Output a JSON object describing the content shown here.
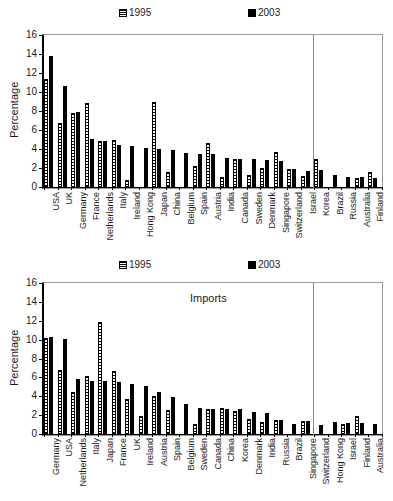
{
  "figure": {
    "width": 393,
    "height": 501,
    "background": "#ffffff",
    "ink_color": "#000000"
  },
  "legend": {
    "entries": [
      {
        "label": "1995",
        "pattern": "horizontal-hatch",
        "color": "#ffffff"
      },
      {
        "label": "2003",
        "pattern": "solid",
        "color": "#000000"
      }
    ]
  },
  "chart_data": [
    {
      "type": "bar",
      "title": "Exports",
      "xlabel": "",
      "ylabel": "Percentage",
      "ylim": [
        0,
        16
      ],
      "yticks": [
        0,
        2,
        4,
        6,
        8,
        10,
        12,
        14,
        16
      ],
      "grid": false,
      "legend_position": "top",
      "divider_after_category": "Israel",
      "categories": [
        "USA",
        "UK",
        "Germany",
        "France",
        "Netherlands",
        "Italy",
        "Ireland",
        "Hong Kong",
        "Japan",
        "China",
        "Belgium",
        "Spain",
        "Austria",
        "India",
        "Canada",
        "Sweden",
        "Denmark",
        "Singapore",
        "Switzerland",
        "Israel",
        "Korea",
        "Brazil",
        "Russia",
        "Australia",
        "Finland"
      ],
      "series": [
        {
          "name": "1995",
          "values": [
            11.4,
            6.7,
            7.8,
            8.8,
            4.8,
            4.9,
            0.7,
            0.0,
            9.0,
            1.6,
            0.0,
            2.2,
            4.6,
            1.1,
            2.9,
            1.3,
            2.0,
            3.7,
            1.9,
            1.2,
            2.9,
            0.0,
            0.0,
            0.9,
            1.6
          ]
        },
        {
          "name": "2003",
          "values": [
            13.8,
            10.6,
            7.9,
            5.1,
            4.8,
            4.4,
            4.3,
            4.1,
            4.0,
            3.9,
            3.6,
            3.5,
            3.5,
            3.1,
            3.0,
            3.0,
            2.8,
            2.7,
            1.9,
            1.7,
            1.8,
            1.3,
            1.1,
            1.1,
            1.0
          ]
        }
      ]
    },
    {
      "type": "bar",
      "title": "Imports",
      "xlabel": "",
      "ylabel": "Percentage",
      "ylim": [
        0,
        16
      ],
      "yticks": [
        0,
        2,
        4,
        6,
        8,
        10,
        12,
        14,
        16
      ],
      "grid": false,
      "legend_position": "top",
      "divider_after_category": "Singapore",
      "categories": [
        "Germany",
        "USA",
        "Netherlands",
        "Italy",
        "Japan",
        "France",
        "UK",
        "Ireland",
        "Austria",
        "Spain",
        "Belgium",
        "Sweden",
        "Canada",
        "China",
        "Korea",
        "Denmark",
        "India",
        "Russia",
        "Brazil",
        "Singapore",
        "Switzerland",
        "Hong Kong",
        "Israel",
        "Finland",
        "Australia"
      ],
      "series": [
        {
          "name": "1995",
          "values": [
            10.2,
            6.8,
            4.5,
            6.2,
            11.9,
            6.7,
            3.7,
            1.9,
            4.0,
            2.5,
            0.0,
            1.1,
            2.6,
            2.8,
            2.4,
            1.6,
            1.3,
            1.5,
            0.0,
            1.4,
            0.0,
            0.0,
            1.1,
            1.9,
            0.0
          ]
        },
        {
          "name": "2003",
          "values": [
            10.3,
            10.1,
            5.8,
            5.6,
            5.6,
            5.5,
            5.3,
            5.1,
            4.5,
            3.9,
            3.2,
            2.8,
            2.7,
            2.7,
            2.7,
            2.3,
            2.2,
            1.5,
            1.1,
            1.4,
            1.0,
            1.3,
            1.2,
            1.2,
            1.1
          ]
        }
      ]
    }
  ]
}
